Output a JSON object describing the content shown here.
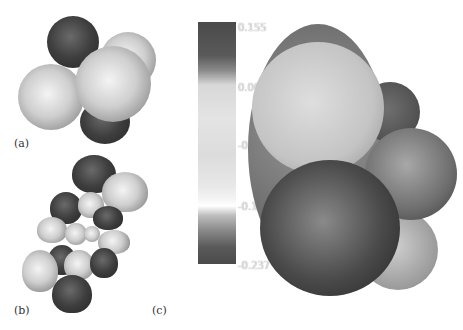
{
  "panels": {
    "a": {
      "label": "(a)",
      "description": "space-filling molecular model with light and dark spheres"
    },
    "b": {
      "label": "(b)",
      "description": "molecular orbital lobes, light and dark phases"
    },
    "c": {
      "label": "(c)",
      "description": "electrostatic potential mapped on molecular surface"
    }
  },
  "colorbar": {
    "ticks": [
      "0.155",
      "0.00791",
      "-0.0738",
      "-0.156",
      "-0.237"
    ],
    "max": 0.155,
    "min": -0.237
  },
  "colors": {
    "light_phase": "#d6d6d6",
    "dark_phase": "#3a3a3a",
    "background": "#ffffff"
  }
}
